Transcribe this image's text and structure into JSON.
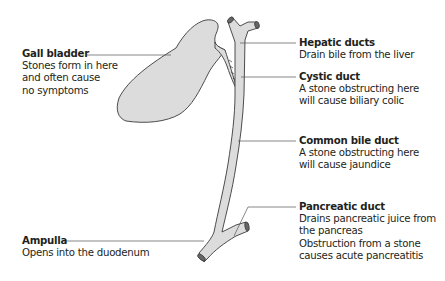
{
  "diagram": {
    "type": "anatomical-diagram",
    "colors": {
      "organ_fill": "#dcdcdc",
      "outline": "#3a3a3a",
      "leader_line": "#555555",
      "text": "#231f20"
    },
    "labels": {
      "gall_bladder": {
        "title": "Gall bladder",
        "description": "Stones form in here\nand often cause\nno symptoms"
      },
      "hepatic_ducts": {
        "title": "Hepatic ducts",
        "description": "Drain bile from the liver"
      },
      "cystic_duct": {
        "title": "Cystic duct",
        "description": "A stone obstructing here\nwill cause biliary colic"
      },
      "common_bile_duct": {
        "title": "Common bile duct",
        "description": "A stone obstructing here\nwill cause jaundice"
      },
      "pancreatic_duct": {
        "title": "Pancreatic duct",
        "description": "Drains pancreatic juice from\nthe pancreas\nObstruction from a stone\ncauses acute pancreatitis"
      },
      "ampulla": {
        "title": "Ampulla",
        "description": "Opens into the duodenum"
      }
    }
  }
}
